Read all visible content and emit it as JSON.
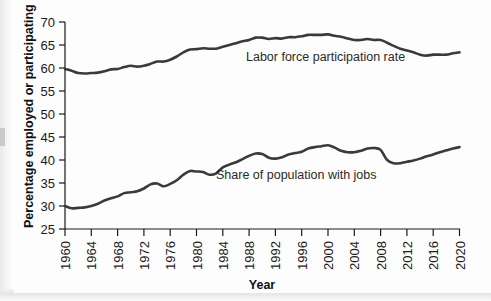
{
  "chart_data": {
    "type": "line",
    "title": "",
    "xlabel": "Year",
    "ylabel": "Percentage employed or participating",
    "xlim": [
      1960,
      2020
    ],
    "ylim": [
      25,
      70
    ],
    "xticks": [
      1960,
      1964,
      1968,
      1972,
      1976,
      1980,
      1984,
      1988,
      1992,
      1996,
      2000,
      2004,
      2008,
      2012,
      2016,
      2020
    ],
    "yticks": [
      25,
      30,
      35,
      40,
      45,
      50,
      55,
      60,
      65,
      70
    ],
    "grid": false,
    "legend_position": "inline-annotation",
    "line_color": "#3a3a3a",
    "x": [
      1960,
      1961,
      1962,
      1963,
      1964,
      1965,
      1966,
      1967,
      1968,
      1969,
      1970,
      1971,
      1972,
      1973,
      1974,
      1975,
      1976,
      1977,
      1978,
      1979,
      1980,
      1981,
      1982,
      1983,
      1984,
      1985,
      1986,
      1987,
      1988,
      1989,
      1990,
      1991,
      1992,
      1993,
      1994,
      1995,
      1996,
      1997,
      1998,
      1999,
      2000,
      2001,
      2002,
      2003,
      2004,
      2005,
      2006,
      2007,
      2008,
      2009,
      2010,
      2011,
      2012,
      2013,
      2014,
      2015,
      2016,
      2017,
      2018,
      2019,
      2020
    ],
    "series": [
      {
        "name": "Labor force participation rate",
        "label": "Labor force participation rate",
        "values": [
          59.8,
          59.4,
          58.9,
          58.8,
          58.9,
          59.0,
          59.3,
          59.7,
          59.8,
          60.2,
          60.5,
          60.3,
          60.5,
          60.9,
          61.4,
          61.4,
          61.8,
          62.5,
          63.4,
          64.0,
          64.1,
          64.3,
          64.2,
          64.2,
          64.6,
          65.0,
          65.4,
          65.8,
          66.1,
          66.6,
          66.6,
          66.3,
          66.5,
          66.4,
          66.7,
          66.7,
          66.9,
          67.2,
          67.2,
          67.2,
          67.3,
          67.0,
          66.8,
          66.4,
          66.1,
          66.1,
          66.3,
          66.1,
          66.1,
          65.5,
          64.8,
          64.2,
          63.8,
          63.4,
          62.9,
          62.7,
          62.9,
          62.9,
          62.9,
          63.2,
          63.4
        ]
      },
      {
        "name": "Share of population with jobs",
        "label": "Share of population with jobs",
        "values": [
          30.0,
          29.5,
          29.6,
          29.7,
          30.0,
          30.5,
          31.2,
          31.7,
          32.1,
          32.8,
          33.0,
          33.2,
          33.8,
          34.7,
          34.9,
          34.3,
          34.8,
          35.6,
          36.8,
          37.6,
          37.5,
          37.4,
          36.8,
          37.1,
          38.4,
          39.0,
          39.5,
          40.2,
          40.9,
          41.4,
          41.3,
          40.5,
          40.3,
          40.6,
          41.2,
          41.5,
          41.8,
          42.5,
          42.8,
          43.0,
          43.2,
          42.7,
          42.0,
          41.7,
          41.7,
          42.0,
          42.5,
          42.6,
          42.2,
          40.0,
          39.3,
          39.3,
          39.6,
          39.9,
          40.3,
          40.8,
          41.2,
          41.7,
          42.1,
          42.5,
          42.8
        ]
      }
    ],
    "annotations": [
      {
        "text": "Labor force participation rate",
        "x": 1991,
        "y": 63.5
      },
      {
        "text": "Share of population with jobs",
        "x": 1985,
        "y": 38.0
      }
    ]
  }
}
